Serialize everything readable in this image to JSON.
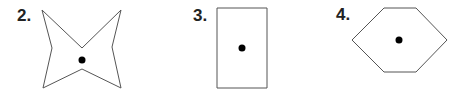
{
  "figures": [
    {
      "label": "2.",
      "shape": "four-pointed-star",
      "points": [
        [
          42,
          10
        ],
        [
          82,
          48
        ],
        [
          121,
          10
        ],
        [
          112,
          47
        ],
        [
          121,
          88
        ],
        [
          82,
          69
        ],
        [
          43,
          88
        ],
        [
          52,
          48
        ]
      ],
      "dot": [
        82,
        60
      ]
    },
    {
      "label": "3.",
      "shape": "rectangle",
      "points": [
        [
          217,
          8
        ],
        [
          267,
          8
        ],
        [
          267,
          88
        ],
        [
          217,
          88
        ]
      ],
      "dot": [
        242,
        48
      ]
    },
    {
      "label": "4.",
      "shape": "hexagon",
      "points": [
        [
          384,
          8
        ],
        [
          416,
          8
        ],
        [
          447,
          40
        ],
        [
          416,
          72
        ],
        [
          384,
          72
        ],
        [
          352,
          40
        ]
      ],
      "dot": [
        399,
        40
      ]
    }
  ],
  "colors": {
    "stroke": "#555555",
    "dot": "#000000",
    "label": "#222222"
  }
}
